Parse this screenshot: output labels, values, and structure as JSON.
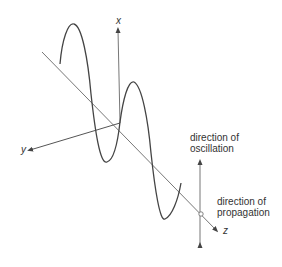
{
  "diagram": {
    "axes": {
      "x": {
        "label": "x"
      },
      "y": {
        "label": "y"
      },
      "z": {
        "label": "z"
      }
    },
    "annotations": {
      "oscillation": {
        "line1": "direction of",
        "line2": "oscillation"
      },
      "propagation": {
        "line1": "direction of",
        "line2": "propagation"
      }
    },
    "colors": {
      "wave": "#444444",
      "axes": "#555555",
      "text": "#333333"
    }
  }
}
